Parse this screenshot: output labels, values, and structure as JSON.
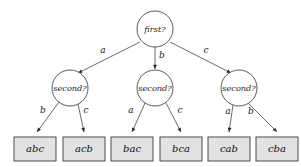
{
  "diagram": {
    "colors": {
      "background": "#ffffff",
      "node_fill": "#ffffff",
      "node_stroke": "#4a4a4a",
      "leaf_fill": "#e2e2e2",
      "leaf_stroke": "#3a3a3a",
      "edge_stroke": "#5a5a5a",
      "arrow_fill": "#2a2a2a",
      "text": "#111111"
    },
    "root": {
      "label": "first?",
      "cx": 155,
      "cy": 29,
      "r": 18
    },
    "internal_nodes": [
      {
        "label": "second?",
        "cx": 70,
        "cy": 88,
        "r": 18
      },
      {
        "label": "second?",
        "cx": 155,
        "cy": 88,
        "r": 18
      },
      {
        "label": "second?",
        "cx": 239,
        "cy": 88,
        "r": 18
      }
    ],
    "leaves": [
      {
        "label": "abc",
        "x": 14,
        "y": 137,
        "w": 42,
        "h": 24
      },
      {
        "label": "acb",
        "x": 63,
        "y": 137,
        "w": 42,
        "h": 24
      },
      {
        "label": "bac",
        "x": 111,
        "y": 137,
        "w": 42,
        "h": 24
      },
      {
        "label": "bca",
        "x": 160,
        "y": 137,
        "w": 42,
        "h": 24
      },
      {
        "label": "cab",
        "x": 208,
        "y": 137,
        "w": 42,
        "h": 24
      },
      {
        "label": "cba",
        "x": 256,
        "y": 137,
        "w": 42,
        "h": 24
      }
    ],
    "top_edges": [
      {
        "label": "a",
        "x1": 140,
        "y1": 42,
        "x2": 78,
        "y2": 73,
        "lx": 103,
        "ly": 50
      },
      {
        "label": "b",
        "x1": 155,
        "y1": 47,
        "x2": 155,
        "y2": 69,
        "lx": 162,
        "ly": 55
      },
      {
        "label": "c",
        "x1": 170,
        "y1": 42,
        "x2": 231,
        "y2": 73,
        "lx": 206,
        "ly": 50
      }
    ],
    "bottom_edges": [
      {
        "label": "b",
        "x1": 59,
        "y1": 102,
        "x2": 37,
        "y2": 132,
        "lx": 43,
        "ly": 110
      },
      {
        "label": "c",
        "x1": 78,
        "y1": 104,
        "x2": 84,
        "y2": 132,
        "lx": 86,
        "ly": 110
      },
      {
        "label": "a",
        "x1": 145,
        "y1": 103,
        "x2": 132,
        "y2": 132,
        "lx": 131,
        "ly": 110
      },
      {
        "label": "c",
        "x1": 166,
        "y1": 103,
        "x2": 181,
        "y2": 132,
        "lx": 180,
        "ly": 110
      },
      {
        "label": "a",
        "x1": 233,
        "y1": 105,
        "x2": 229,
        "y2": 132,
        "lx": 228,
        "ly": 111
      },
      {
        "label": "b",
        "x1": 248,
        "y1": 103,
        "x2": 277,
        "y2": 132,
        "lx": 251,
        "ly": 111
      }
    ]
  }
}
